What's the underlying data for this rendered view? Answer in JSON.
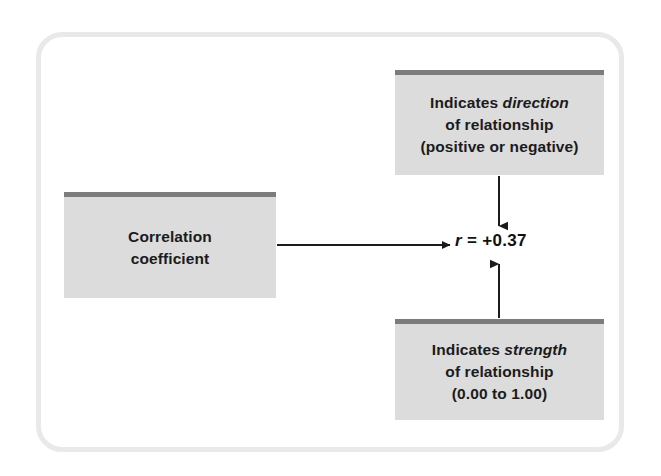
{
  "figure": {
    "type": "concept-diagram",
    "title_visible": false,
    "background_color": "#ffffff",
    "frame": {
      "border_color": "#e9e9e9",
      "corner_radius_px": 26
    },
    "box_style": {
      "fill_color": "#dcdcdc",
      "cap_bar_color": "#7c7c7c",
      "text_color": "#1b1b1b"
    },
    "arrow_color": "#1b1b1b"
  },
  "boxes": {
    "correlation": {
      "line1": "Correlation",
      "line2": "coefficient"
    },
    "direction": {
      "line1_prefix": "Indicates ",
      "line1_emphasis": "direction",
      "line2": "of relationship",
      "line3": "(positive or negative)"
    },
    "strength": {
      "line1_prefix": "Indicates ",
      "line1_emphasis": "strength",
      "line2": "of relationship",
      "line3": "(0.00 to 1.00)"
    }
  },
  "center_value": {
    "symbol": "r",
    "operator": " = ",
    "value": "+0.37"
  },
  "arrows": [
    {
      "name": "correlation-to-value",
      "direction": "right",
      "from": "correlation-box",
      "to": "center-value"
    },
    {
      "name": "direction-to-value",
      "direction": "down",
      "from": "direction-box",
      "to": "center-value"
    },
    {
      "name": "strength-to-value",
      "direction": "up",
      "from": "strength-box",
      "to": "center-value"
    }
  ]
}
